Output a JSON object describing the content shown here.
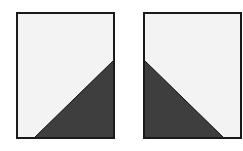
{
  "colors": {
    "background": "#ffffff",
    "panel_fill": "#f3f3f3",
    "shade_fill": "#3e3e3e",
    "border": "#1a1a1a"
  },
  "panels": [
    {
      "name": "left-panel",
      "rect": {
        "x": 17,
        "y": 13,
        "w": 97,
        "h": 125
      },
      "triangle": "34,138 114,60 114,138",
      "orientation": "bottom-right shaded"
    },
    {
      "name": "right-panel",
      "rect": {
        "x": 144,
        "y": 13,
        "w": 97,
        "h": 125
      },
      "triangle": "144,60 224,138 144,138",
      "orientation": "bottom-left shaded"
    }
  ]
}
